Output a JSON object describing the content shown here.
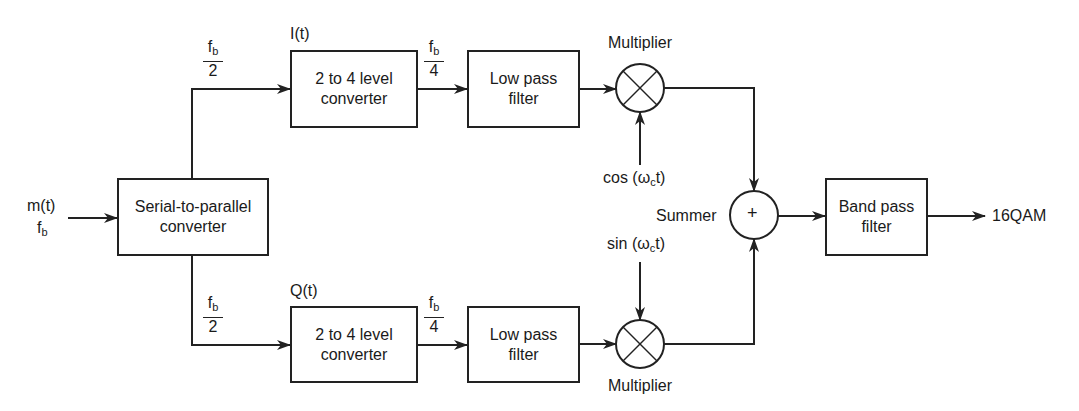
{
  "diagram": {
    "input": {
      "signal": "m(t)",
      "rate": "f",
      "rate_sub": "b"
    },
    "blocks": {
      "serial_to_parallel": "Serial-to-parallel converter",
      "top_converter": "2 to 4 level converter",
      "bottom_converter": "2 to 4 level converter",
      "top_lpf": "Low pass filter",
      "bottom_lpf": "Low pass filter",
      "bpf": "Band pass filter"
    },
    "labels": {
      "i_channel": "I(t)",
      "q_channel": "Q(t)",
      "multiplier_top": "Multiplier",
      "multiplier_bottom": "Multiplier",
      "summer": "Summer",
      "summer_symbol": "+",
      "cos_carrier": {
        "pre": "cos (ω",
        "sub": "c",
        "post": "t)"
      },
      "sin_carrier": {
        "pre": "sin (ω",
        "sub": "c",
        "post": "t)"
      },
      "output": "16QAM"
    },
    "rates": {
      "half_num": "f",
      "half_sub": "b",
      "half_den": "2",
      "quarter_num": "f",
      "quarter_sub": "b",
      "quarter_den": "4"
    }
  }
}
